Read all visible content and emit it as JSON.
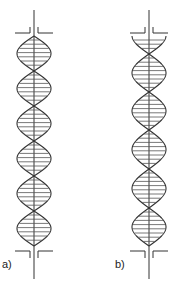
{
  "figure": {
    "stroke_color": "#333333",
    "panels": [
      {
        "id": "a",
        "label": "a)",
        "axis_x": 34,
        "axis_top": 10,
        "axis_bottom": 279,
        "helix_top": 36,
        "helix_bottom": 246,
        "lobe_boundaries": [
          36,
          71,
          106,
          141,
          176,
          211,
          246
        ],
        "half_width": 17,
        "bracket_top_y": 27,
        "bracket_bottom_y": 251,
        "label_x": 2,
        "label_y": 259
      },
      {
        "id": "b",
        "label": "b)",
        "axis_x": 149,
        "axis_top": 10,
        "axis_bottom": 279,
        "helix_top": 36,
        "helix_bottom": 246,
        "lobe_boundaries": [
          17,
          54,
          92,
          130,
          169,
          208,
          246
        ],
        "half_width": 17,
        "bracket_top_y": 27,
        "bracket_bottom_y": 251,
        "label_x": 115,
        "label_y": 259
      }
    ]
  }
}
